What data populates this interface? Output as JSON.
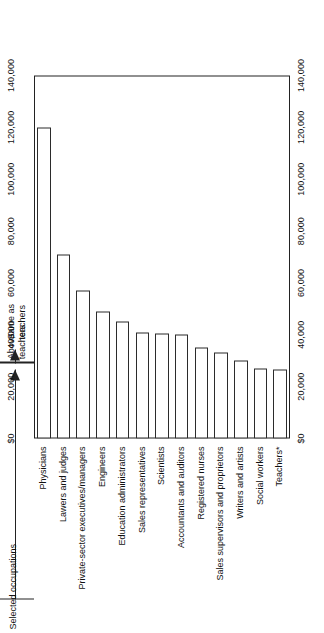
{
  "chart_data": {
    "type": "bar",
    "orientation": "horizontal",
    "title": "",
    "xlabel": "",
    "ylabel": "Selected occupations",
    "categories": [
      "Physicians",
      "Lawers and judges",
      "Private-sector executives/managers",
      "Engineers",
      "Education administrators",
      "Sales representatives",
      "Scientists",
      "Accountants and auditors",
      "Registered nurses",
      "Sales supervisors and proprietors",
      "Writers and artists",
      "Social workers",
      "Teachers*"
    ],
    "values": [
      120000,
      71000,
      57000,
      49000,
      45000,
      41000,
      40500,
      40000,
      35000,
      33000,
      30000,
      27000,
      26500
    ],
    "xlim": [
      0,
      140000
    ],
    "tick_labels": [
      "$0",
      "20,000",
      "40,000",
      "60,000",
      "80,000",
      "100,000",
      "120,000",
      "140,000"
    ],
    "tick_values": [
      0,
      20000,
      40000,
      60000,
      80000,
      100000,
      120000,
      140000
    ],
    "grid": false,
    "legend": null,
    "annotations": [
      {
        "id": "above-teachers",
        "label": "Above\nteachers",
        "label_line1": "Above",
        "label_line2": "teachers",
        "covers_categories": [
          "Physicians",
          "Lawers and judges",
          "Private-sector executives/managers",
          "Engineers",
          "Education administrators",
          "Sales representatives",
          "Scientists",
          "Accountants and auditors",
          "Registered nurses",
          "Sales supervisors and proprietors",
          "Writers and artists",
          "Social workers"
        ]
      },
      {
        "id": "same-as-teachers",
        "label": "Same as\nteachers",
        "label_line1": "Same as",
        "label_line2": "teachers",
        "covers_categories": [
          "Teachers*"
        ]
      }
    ]
  },
  "axis": {
    "category_axis_title": "Selected occupations",
    "value_ticks_top": [
      "$0",
      "20,000",
      "40,000",
      "60,000",
      "80,000",
      "100,000",
      "120,000",
      "140,000"
    ],
    "value_ticks_bottom": [
      "$0",
      "20,000",
      "40,000",
      "60,000",
      "80,000",
      "100,000",
      "120,000",
      "140,000"
    ]
  },
  "colors": {
    "ink": "#222222",
    "bar_fill": "#ffffff",
    "bar_stroke": "#2b2b2b",
    "background": "#ffffff"
  }
}
